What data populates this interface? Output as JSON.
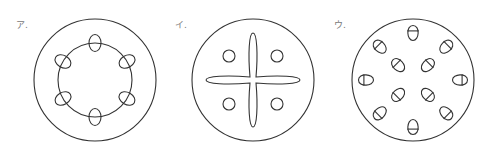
{
  "colors": {
    "stroke": "#333333",
    "label": "#777777",
    "background": "#ffffff"
  },
  "figures": [
    {
      "id": "a",
      "label": "ア.",
      "label_pos": [
        16,
        28
      ],
      "center": [
        95,
        80
      ],
      "outer_radius": 61,
      "inner_radius": 37,
      "bundles": {
        "count": 6,
        "radius": 37,
        "start_angle": -90,
        "rx": 6,
        "ry": 8.5
      }
    },
    {
      "id": "i",
      "label": "イ.",
      "label_pos": [
        175,
        28
      ],
      "center": [
        253,
        80
      ],
      "outer_radius": 61,
      "cross": {
        "arm_length": 47,
        "arm_half_width": 5,
        "center_half_width": 3
      },
      "small_circles": {
        "offsets": [
          [
            -24,
            -24
          ],
          [
            24,
            -24
          ],
          [
            -24,
            24
          ],
          [
            24,
            24
          ]
        ],
        "r": 6
      }
    },
    {
      "id": "u",
      "label": "ウ.",
      "label_pos": [
        334,
        28
      ],
      "center": [
        413,
        80
      ],
      "outer_radius": 61,
      "outer_bundles": {
        "count": 8,
        "radius": 47,
        "start_angle": -90
      },
      "inner_bundles": {
        "count": 4,
        "radius": 21,
        "start_angle": -45
      },
      "bundle_size": {
        "half_width": 5.5,
        "length": 15
      }
    }
  ]
}
